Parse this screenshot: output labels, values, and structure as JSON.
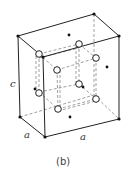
{
  "figure": {
    "caption": "(b)",
    "labels": {
      "height": "c",
      "edge_left": "a",
      "edge_right": "a"
    }
  },
  "colors": {
    "line": "#222222",
    "dashed": "#888888",
    "background": "#ffffff"
  },
  "structure": {
    "type": "unit-cell",
    "corner_atoms": "filled-dot",
    "interior_atoms": "open-circle",
    "face_atoms": "filled-dot"
  }
}
